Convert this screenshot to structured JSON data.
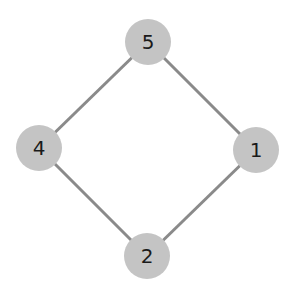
{
  "diagram": {
    "type": "graph",
    "colors": {
      "node_fill": "#c4c4c4",
      "edge": "#8a8a8a",
      "label": "#1a1a1a"
    },
    "nodes": [
      {
        "id": "5",
        "label": "5",
        "x": 148,
        "y": 42
      },
      {
        "id": "4",
        "label": "4",
        "x": 39,
        "y": 148
      },
      {
        "id": "1",
        "label": "1",
        "x": 256,
        "y": 150
      },
      {
        "id": "2",
        "label": "2",
        "x": 147,
        "y": 256
      }
    ],
    "edges": [
      {
        "from": "5",
        "to": "4"
      },
      {
        "from": "5",
        "to": "1"
      },
      {
        "from": "4",
        "to": "2"
      },
      {
        "from": "1",
        "to": "2"
      }
    ]
  }
}
